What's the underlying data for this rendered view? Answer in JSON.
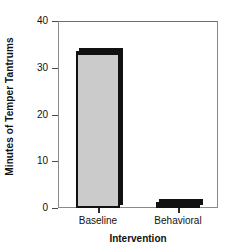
{
  "chart_data": {
    "type": "bar",
    "title": "",
    "subtitle": "",
    "xlabel": "Intervention",
    "ylabel": "Minutes of Temper Tantrums",
    "categories": [
      "Baseline",
      "Behavioral"
    ],
    "values": [
      33.5,
      1.3
    ],
    "series": [
      {
        "name": "Minutes of Temper Tantrums",
        "values": [
          33.5,
          1.3
        ]
      }
    ],
    "ylim": [
      0,
      40
    ],
    "yticks": [
      0,
      10,
      20,
      30,
      40
    ],
    "ytick_labels": [
      "0",
      "10",
      "20",
      "30",
      "40"
    ],
    "grid": false,
    "legend": false,
    "legend_position": "none",
    "bar_fill_color": "#cbcbcb",
    "bar_edge_color": "#111111",
    "frame_color": "#8a8a8a",
    "text_color": "#111111",
    "annotations": []
  }
}
